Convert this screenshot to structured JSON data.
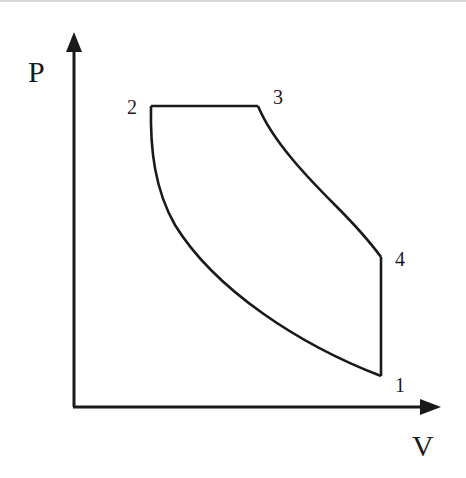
{
  "diagram": {
    "type": "pv-diagram",
    "axes": {
      "y_label": "P",
      "x_label": "V"
    },
    "points": [
      {
        "id": "1",
        "label": "1"
      },
      {
        "id": "2",
        "label": "2"
      },
      {
        "id": "3",
        "label": "3"
      },
      {
        "id": "4",
        "label": "4"
      }
    ],
    "processes": [
      {
        "from": "1",
        "to": "2",
        "shape": "curve"
      },
      {
        "from": "2",
        "to": "3",
        "shape": "horizontal-line"
      },
      {
        "from": "3",
        "to": "4",
        "shape": "curve"
      },
      {
        "from": "4",
        "to": "1",
        "shape": "vertical-line"
      }
    ],
    "colors": {
      "line": "#1a1a1a",
      "background": "#ffffff"
    }
  }
}
